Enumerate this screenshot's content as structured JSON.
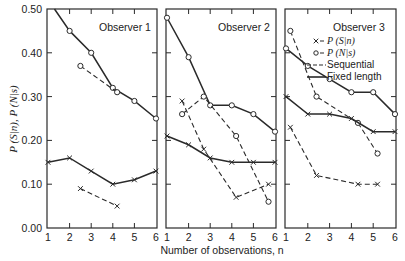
{
  "chart_data": {
    "type": "line",
    "ylabel": "P (S|n), P (N|s)",
    "xlabel": "Number of observations, n",
    "ylim": [
      0.0,
      0.5
    ],
    "yticks": [
      "0.00",
      "0.10",
      "0.20",
      "0.30",
      "0.40",
      "0.50"
    ],
    "xticks": [
      "1",
      "2",
      "3",
      "4",
      "5",
      "6"
    ],
    "legend": {
      "position": "top-right (inside Observer 3 panel)",
      "entries": [
        {
          "marker": "x",
          "label": "P (S|n)"
        },
        {
          "marker": "o",
          "label": "P (N|s)"
        },
        {
          "style": "dashed",
          "label": "Sequential"
        },
        {
          "style": "solid",
          "label": "Fixed length"
        }
      ]
    },
    "panels": [
      {
        "title": "Observer 1",
        "series": [
          {
            "name": "P (N|s) Fixed length",
            "marker": "o",
            "style": "solid",
            "x": [
              1.3,
              2,
              3,
              4,
              5,
              6
            ],
            "y": [
              0.5,
              0.45,
              0.4,
              0.32,
              0.29,
              0.25
            ],
            "markers_from": 1
          },
          {
            "name": "P (N|s) Sequential",
            "marker": "o",
            "style": "dashed",
            "x": [
              2.5,
              4.2
            ],
            "y": [
              0.37,
              0.31
            ]
          },
          {
            "name": "P (S|n) Fixed length",
            "marker": "x",
            "style": "solid",
            "x": [
              1,
              2,
              3,
              4,
              5,
              6
            ],
            "y": [
              0.15,
              0.16,
              0.13,
              0.1,
              0.11,
              0.13
            ]
          },
          {
            "name": "P (S|n) Sequential",
            "marker": "x",
            "style": "dashed",
            "x": [
              2.5,
              4.2
            ],
            "y": [
              0.09,
              0.05
            ]
          }
        ]
      },
      {
        "title": "Observer 2",
        "series": [
          {
            "name": "P (N|s) Fixed length",
            "marker": "o",
            "style": "solid",
            "x": [
              1,
              2,
              3,
              4,
              5,
              6
            ],
            "y": [
              0.48,
              0.39,
              0.28,
              0.28,
              0.26,
              0.22
            ]
          },
          {
            "name": "P (N|s) Sequential",
            "marker": "o",
            "style": "dashed",
            "x": [
              1.7,
              2.7,
              4.2,
              5.7
            ],
            "y": [
              0.26,
              0.3,
              0.21,
              0.06
            ]
          },
          {
            "name": "P (S|n) Fixed length",
            "marker": "x",
            "style": "solid",
            "x": [
              1,
              2,
              3,
              4,
              5,
              6
            ],
            "y": [
              0.21,
              0.19,
              0.16,
              0.15,
              0.15,
              0.15
            ]
          },
          {
            "name": "P (S|n) Sequential",
            "marker": "x",
            "style": "dashed",
            "x": [
              1.7,
              2.7,
              4.2,
              5.7
            ],
            "y": [
              0.29,
              0.18,
              0.07,
              0.1
            ]
          }
        ]
      },
      {
        "title": "Observer 3",
        "series": [
          {
            "name": "P (N|s) Fixed length",
            "marker": "o",
            "style": "solid",
            "x": [
              1,
              2,
              3,
              4,
              5,
              6
            ],
            "y": [
              0.41,
              0.37,
              0.34,
              0.31,
              0.31,
              0.26
            ]
          },
          {
            "name": "P (N|s) Sequential",
            "marker": "o",
            "style": "dashed",
            "x": [
              1.2,
              2.4,
              4.3,
              5.2
            ],
            "y": [
              0.45,
              0.3,
              0.24,
              0.17
            ]
          },
          {
            "name": "P (S|n) Fixed length",
            "marker": "x",
            "style": "solid",
            "x": [
              1,
              2,
              3,
              4,
              5,
              6
            ],
            "y": [
              0.3,
              0.26,
              0.26,
              0.25,
              0.22,
              0.22
            ]
          },
          {
            "name": "P (S|n) Sequential",
            "marker": "x",
            "style": "dashed",
            "x": [
              1.2,
              2.4,
              4.3,
              5.2
            ],
            "y": [
              0.23,
              0.12,
              0.1,
              0.1
            ]
          }
        ]
      }
    ]
  },
  "colors": {
    "ink": "#2a2a2a",
    "background": "#ffffff"
  }
}
